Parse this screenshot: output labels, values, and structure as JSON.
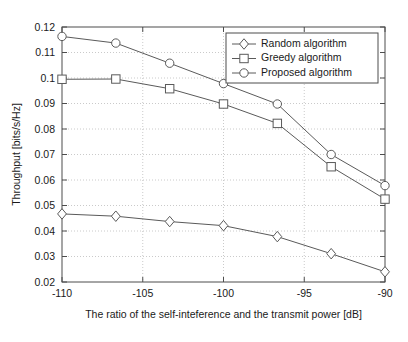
{
  "chart_data": {
    "type": "line",
    "title": "",
    "xlabel": "The ratio of the self-inteference and the transmit power [dB]",
    "ylabel": "Throughput [bits/s/Hz]",
    "xlim": [
      -110,
      -90
    ],
    "ylim": [
      0.02,
      0.12
    ],
    "xticks": [
      -110,
      -105,
      -100,
      -95,
      -90
    ],
    "xtick_labels": [
      "-110",
      "-105",
      "-100",
      "-95",
      "-90"
    ],
    "yticks": [
      0.02,
      0.03,
      0.04,
      0.05,
      0.06,
      0.07,
      0.08,
      0.09,
      0.1,
      0.11,
      0.12
    ],
    "ytick_labels": [
      "0.02",
      "0.03",
      "0.04",
      "0.05",
      "0.06",
      "0.07",
      "0.08",
      "0.09",
      "0.1",
      "0.11",
      "0.12"
    ],
    "grid": true,
    "legend_position": "upper right",
    "x": [
      -110,
      -106.667,
      -103.333,
      -100,
      -96.667,
      -93.333,
      -90
    ],
    "series": [
      {
        "name": "Random algorithm",
        "marker": "diamond",
        "values": [
          0.0467,
          0.0458,
          0.0437,
          0.0421,
          0.0378,
          0.0311,
          0.024
        ]
      },
      {
        "name": "Greedy algorithm",
        "marker": "square",
        "values": [
          0.0995,
          0.0996,
          0.0958,
          0.0898,
          0.0822,
          0.0652,
          0.0525
        ]
      },
      {
        "name": "Proposed algorithm",
        "marker": "circle",
        "values": [
          0.1163,
          0.1137,
          0.1058,
          0.0978,
          0.0898,
          0.07,
          0.0578
        ]
      }
    ]
  }
}
